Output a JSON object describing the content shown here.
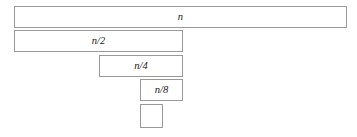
{
  "figure": {
    "name": "recursive-halving-bars",
    "background_color": "#ffffff",
    "width": 357,
    "height": 137,
    "border_color": "#9a9a9a",
    "fill_color": "#ffffff",
    "text_color": "#1a1a1a"
  },
  "bars": [
    {
      "id": "bar-n",
      "label": "n",
      "level": 0,
      "x": 14,
      "y": 6,
      "width": 333,
      "height": 22,
      "has_label": true
    },
    {
      "id": "bar-n-over-2",
      "label": "n/2",
      "level": 1,
      "x": 14,
      "y": 30,
      "width": 169,
      "height": 22,
      "has_label": true
    },
    {
      "id": "bar-n-over-4",
      "label": "n/4",
      "level": 2,
      "x": 99,
      "y": 55,
      "width": 84,
      "height": 22,
      "has_label": true
    },
    {
      "id": "bar-n-over-8",
      "label": "n/8",
      "level": 3,
      "x": 140,
      "y": 79,
      "width": 43,
      "height": 22,
      "has_label": true
    },
    {
      "id": "bar-unlabeled",
      "label": "",
      "level": 4,
      "x": 140,
      "y": 104,
      "width": 23,
      "height": 24,
      "has_label": false
    }
  ]
}
